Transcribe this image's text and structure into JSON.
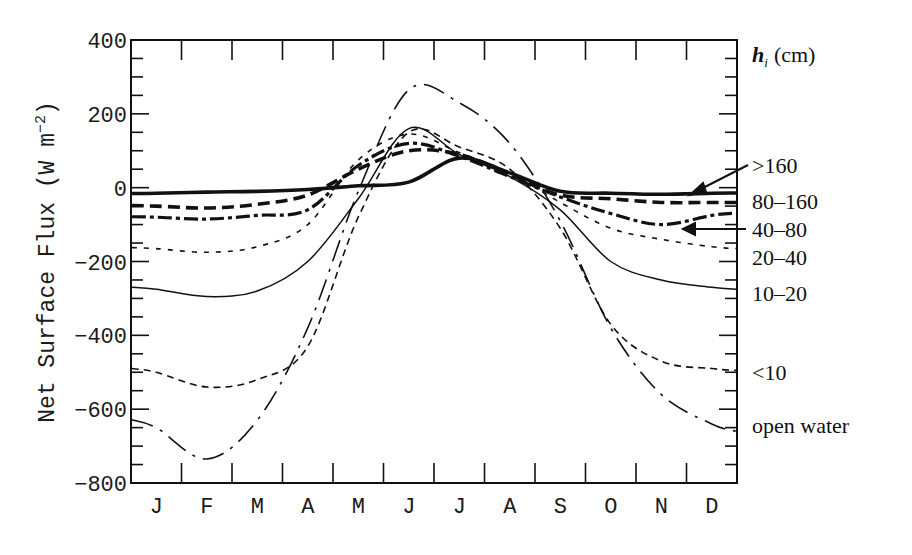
{
  "chart_data": {
    "type": "line",
    "title": "",
    "xlabel": "",
    "ylabel": "Net Surface Flux (W m^-2)",
    "ylabel_parts": {
      "main": "Net Surface Flux (W m",
      "exp": "−2",
      "close": ")"
    },
    "ylim": [
      -800,
      400
    ],
    "yticks": [
      400,
      200,
      0,
      -200,
      -400,
      -600,
      -800
    ],
    "ytick_labels": [
      "400",
      "200",
      "0",
      "−200",
      "−400",
      "−600",
      "−800"
    ],
    "y_minor_step": 50,
    "categories": [
      "J",
      "F",
      "M",
      "A",
      "M",
      "J",
      "J",
      "A",
      "S",
      "O",
      "N",
      "D"
    ],
    "legend_title": {
      "main": "h",
      "sub": "i",
      "unit": "(cm)"
    },
    "legend_position": "right",
    "grid": false,
    "series": [
      {
        "name": ">160",
        "style": "thick-solid",
        "values": [
          -15,
          -12,
          -10,
          -5,
          5,
          15,
          80,
          40,
          -10,
          -15,
          -18,
          -15
        ]
      },
      {
        "name": "80–160",
        "style": "thick-dash",
        "values": [
          -50,
          -55,
          -45,
          -20,
          50,
          100,
          90,
          35,
          -20,
          -30,
          -40,
          -40
        ]
      },
      {
        "name": "40–80",
        "style": "thick-dash-dot",
        "values": [
          -80,
          -85,
          -75,
          -60,
          60,
          120,
          85,
          30,
          -25,
          -70,
          -100,
          -75
        ]
      },
      {
        "name": "20–40",
        "style": "dotted",
        "values": [
          -165,
          -175,
          -160,
          -100,
          75,
          145,
          95,
          40,
          -40,
          -110,
          -140,
          -160
        ]
      },
      {
        "name": "10–20",
        "style": "thin-solid",
        "values": [
          -275,
          -295,
          -280,
          -200,
          -30,
          160,
          90,
          30,
          -60,
          -200,
          -250,
          -270
        ]
      },
      {
        "name": "<10",
        "style": "thin-dash",
        "values": [
          -500,
          -540,
          -520,
          -430,
          -80,
          150,
          110,
          50,
          -110,
          -370,
          -470,
          -490
        ]
      },
      {
        "name": "open water",
        "style": "dash-dot",
        "values": [
          -650,
          -735,
          -630,
          -380,
          -10,
          265,
          230,
          120,
          -90,
          -380,
          -560,
          -640
        ]
      }
    ],
    "annotations": [
      {
        "label": ">160",
        "type": "arrow",
        "points_to": "thick-solid curve near N-D"
      },
      {
        "label": "40–80",
        "type": "arrow",
        "points_to": "thick dash-dot curve near N-D"
      }
    ]
  }
}
